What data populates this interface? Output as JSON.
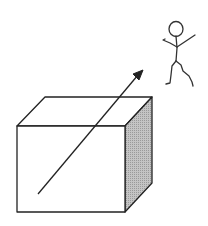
{
  "diagram": {
    "elements": [
      {
        "name": "box",
        "type": "cube"
      },
      {
        "name": "arrow",
        "type": "arrow",
        "direction": "up-right"
      },
      {
        "name": "stick-figure",
        "type": "person"
      }
    ],
    "colors": {
      "line": "#222222",
      "shade": "#b8b8b8",
      "background": "#ffffff"
    }
  }
}
